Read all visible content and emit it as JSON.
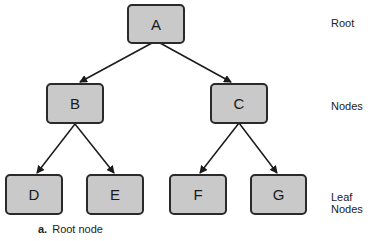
{
  "nodes": {
    "A": "A",
    "B": "B",
    "C": "C",
    "D": "D",
    "E": "E",
    "F": "F",
    "G": "G"
  },
  "level_labels": {
    "root": "Root",
    "nodes": "Nodes",
    "leaf": "Leaf Nodes"
  },
  "caption": {
    "marker": "a.",
    "text": "Root node"
  },
  "colors": {
    "node_fill": "#c9c9c9",
    "node_border": "#2a2a2a",
    "edge": "#1a1a1a"
  }
}
